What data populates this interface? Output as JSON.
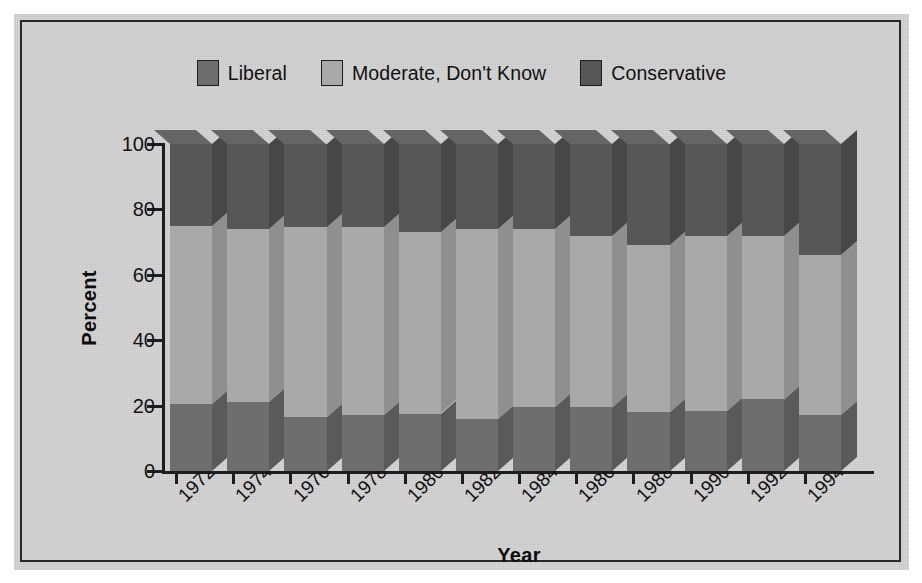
{
  "chart_data": {
    "type": "bar",
    "subtype": "stacked-3d-column",
    "title": "",
    "xlabel": "Year",
    "ylabel": "Percent",
    "ylim": [
      0,
      100
    ],
    "yticks": [
      0,
      20,
      40,
      60,
      80,
      100
    ],
    "grid": false,
    "legend_position": "top-center",
    "categories": [
      "1972",
      "1974",
      "1976",
      "1978",
      "1980",
      "1982",
      "1984",
      "1986",
      "1988",
      "1990",
      "1992",
      "1994"
    ],
    "series": [
      {
        "name": "Liberal",
        "color": "#6e6e6e",
        "values": [
          20.5,
          21.0,
          16.5,
          17.0,
          17.5,
          16.0,
          19.5,
          19.5,
          18.0,
          18.5,
          22.0,
          17.0
        ]
      },
      {
        "name": "Moderate, Don't Know",
        "color": "#a9a9a9",
        "values": [
          54.5,
          53.0,
          58.0,
          57.5,
          55.5,
          58.0,
          54.5,
          52.5,
          51.0,
          53.5,
          50.0,
          49.0
        ]
      },
      {
        "name": "Conservative",
        "color": "#575757",
        "values": [
          25.0,
          26.0,
          25.5,
          25.5,
          27.0,
          26.0,
          26.0,
          28.0,
          31.0,
          28.0,
          28.0,
          34.0
        ]
      }
    ],
    "segment_tops_percent": {
      "liberal": [
        20.5,
        21.0,
        16.5,
        17.0,
        17.5,
        16.0,
        19.5,
        19.5,
        18.0,
        18.5,
        22.0,
        17.0
      ],
      "moderate": [
        75.0,
        74.0,
        74.5,
        74.5,
        73.0,
        74.0,
        74.0,
        72.0,
        69.0,
        72.0,
        72.0,
        66.0
      ],
      "conservative": [
        100,
        100,
        100,
        100,
        100,
        100,
        100,
        100,
        100,
        100,
        100,
        100
      ]
    }
  },
  "legend": {
    "items": [
      {
        "label": "Liberal",
        "color": "#6e6e6e"
      },
      {
        "label": "Moderate, Don't Know",
        "color": "#a9a9a9"
      },
      {
        "label": "Conservative",
        "color": "#575757"
      }
    ]
  },
  "axes": {
    "y": {
      "title": "Percent",
      "ticks": [
        "0",
        "20",
        "40",
        "60",
        "80",
        "100"
      ]
    },
    "x": {
      "title": "Year",
      "ticks": [
        "1972",
        "1974",
        "1976",
        "1978",
        "1980",
        "1982",
        "1984",
        "1986",
        "1988",
        "1990",
        "1992",
        "1994"
      ]
    }
  },
  "colors": {
    "background": "#d4d4d4",
    "page": "#ffffff",
    "frame": "#2a2a2a",
    "axis": "#1e1e1e",
    "text": "#111111",
    "liberal": "#6e6e6e",
    "moderate": "#a9a9a9",
    "conservative": "#575757",
    "liberal_side": "#5a5a5a",
    "moderate_side": "#8f8f8f",
    "conservative_side": "#474747",
    "liberal_top": "#7d7d7d",
    "moderate_top": "#b8b8b8",
    "conservative_top": "#656565"
  }
}
